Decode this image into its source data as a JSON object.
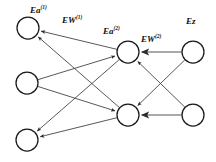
{
  "figure": {
    "type": "neural-network-backpropagation-diagram",
    "background_color": "#ffffff",
    "node_stroke_color": "#1a1a1a",
    "edge_color": "#3a3a3a",
    "gray_edge_color": "#8c8c8c"
  },
  "labels": [
    {
      "id": "ea1",
      "name": "Ea^(1)",
      "base": "Ea",
      "sup": "(1)",
      "x": 30,
      "y": 6
    },
    {
      "id": "ew1",
      "name": "EW^(1)",
      "base": "EW",
      "sup": "(1)",
      "x": 62,
      "y": 16
    },
    {
      "id": "ea2",
      "name": "Ea^(2)",
      "base": "Ea",
      "sup": "(2)",
      "x": 103,
      "y": 27
    },
    {
      "id": "ew2",
      "name": "EW^(2)",
      "base": "EW",
      "sup": "(2)",
      "x": 141,
      "y": 35
    },
    {
      "id": "ez",
      "name": "Ez",
      "base": "Ez",
      "sup": "",
      "x": 186,
      "y": 17
    }
  ],
  "nodes": [
    {
      "id": "L1",
      "layer": "left",
      "cx": 28,
      "cy": 28,
      "r": 11
    },
    {
      "id": "L2",
      "layer": "left",
      "cx": 27,
      "cy": 83,
      "r": 11
    },
    {
      "id": "L3",
      "layer": "left",
      "cx": 27,
      "cy": 140,
      "r": 11
    },
    {
      "id": "M1",
      "layer": "middle",
      "cx": 128,
      "cy": 52,
      "r": 11
    },
    {
      "id": "M2",
      "layer": "middle",
      "cx": 128,
      "cy": 115,
      "r": 11
    },
    {
      "id": "R1",
      "layer": "right",
      "cx": 193,
      "cy": 52,
      "r": 11
    },
    {
      "id": "R2",
      "layer": "right",
      "cx": 193,
      "cy": 115,
      "r": 11
    }
  ],
  "edges": [
    {
      "id": "e-m1-l1",
      "from": "M1",
      "to": "L1",
      "arrow": "to",
      "color": "#3a3a3a"
    },
    {
      "id": "e-m2-l1",
      "from": "M2",
      "to": "L1",
      "arrow": "to",
      "color": "#3a3a3a"
    },
    {
      "id": "e-m1-l2",
      "from": "M1",
      "to": "L2",
      "arrow": "from",
      "color": "#3a3a3a"
    },
    {
      "id": "e-m2-l2",
      "from": "M2",
      "to": "L2",
      "arrow": "from",
      "color": "#3a3a3a"
    },
    {
      "id": "e-m1-l3",
      "from": "M1",
      "to": "L3",
      "arrow": "to",
      "color": "#3a3a3a"
    },
    {
      "id": "e-m2-l3",
      "from": "M2",
      "to": "L3",
      "arrow": "to",
      "color": "#3a3a3a"
    },
    {
      "id": "e-r1-m1",
      "from": "R1",
      "to": "M1",
      "arrow": "to",
      "color": "#8c8c8c"
    },
    {
      "id": "e-r2-m2",
      "from": "R2",
      "to": "M2",
      "arrow": "to",
      "color": "#8c8c8c"
    },
    {
      "id": "e-r1-m2",
      "from": "R1",
      "to": "M2",
      "arrow": "to",
      "color": "#3a3a3a"
    },
    {
      "id": "e-r2-m1",
      "from": "R2",
      "to": "M1",
      "arrow": "to",
      "color": "#3a3a3a"
    }
  ]
}
